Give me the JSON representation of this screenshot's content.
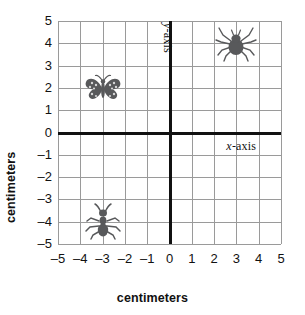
{
  "chart_data": {
    "type": "scatter",
    "title": "",
    "xlabel": "centimeters",
    "ylabel": "centimeters",
    "xlim": [
      -5,
      5
    ],
    "ylim": [
      -5,
      5
    ],
    "grid": true,
    "legend": "none",
    "x_ticks": [
      "–5",
      "–4",
      "–3",
      "–2",
      "–1",
      "0",
      "1",
      "2",
      "3",
      "4",
      "5"
    ],
    "y_ticks": [
      "5",
      "4",
      "3",
      "2",
      "1",
      "0",
      "–1",
      "–2",
      "–3",
      "–4",
      "–5"
    ],
    "x_tick_values": [
      -5,
      -4,
      -3,
      -2,
      -1,
      0,
      1,
      2,
      3,
      4,
      5
    ],
    "y_tick_values": [
      5,
      4,
      3,
      2,
      1,
      0,
      -1,
      -2,
      -3,
      -4,
      -5
    ],
    "axis_labels_in_plot": {
      "x_axis": {
        "var": "x",
        "rest": "-axis"
      },
      "y_axis": {
        "var": "y",
        "rest": "-axis"
      }
    },
    "points": [
      {
        "name": "spider",
        "label": "spider",
        "x": 3,
        "y": 4,
        "quadrant": "I"
      },
      {
        "name": "butterfly",
        "label": "butterfly",
        "x": -3,
        "y": 2,
        "quadrant": "II"
      },
      {
        "name": "ant",
        "label": "ant",
        "x": -3,
        "y": -4,
        "quadrant": "III"
      }
    ],
    "colors": {
      "grid": "#9a9a9a",
      "axis": "#111111",
      "background": "#ffffff",
      "text": "#111111",
      "marker": "#58595b"
    }
  }
}
